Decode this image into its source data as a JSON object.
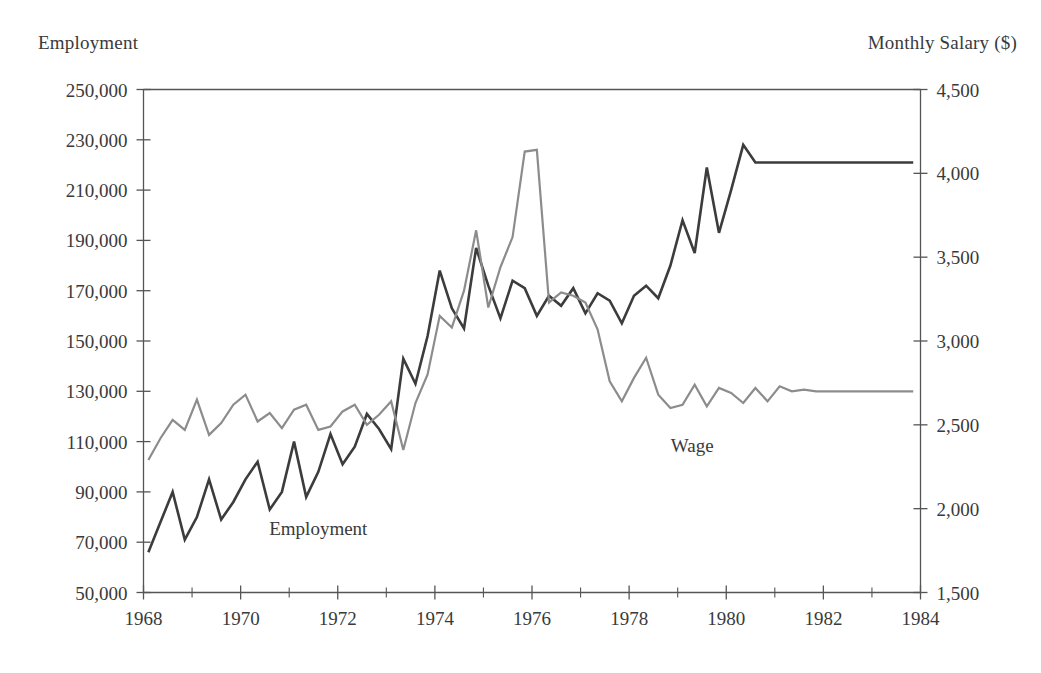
{
  "chart_data": {
    "type": "line",
    "title": "",
    "xlabel": "",
    "ylabel": "Employment",
    "y2label": "Monthly Salary ($)",
    "grid": false,
    "legend_position": "inline-annotation",
    "xlim": [
      1968.0,
      1984.0
    ],
    "ylim": [
      50000,
      250000
    ],
    "y2lim": [
      1500,
      4500
    ],
    "x_ticks": [
      1968,
      1970,
      1972,
      1974,
      1976,
      1978,
      1980,
      1982,
      1984
    ],
    "x_tick_labels": [
      "1968",
      "1970",
      "1972",
      "1974",
      "1976",
      "1978",
      "1980",
      "1982",
      "1984"
    ],
    "x_minor_ticks": [
      1969,
      1971,
      1973,
      1975,
      1977,
      1979,
      1981,
      1983
    ],
    "y_ticks": [
      50000,
      70000,
      90000,
      110000,
      130000,
      150000,
      170000,
      190000,
      210000,
      230000,
      250000
    ],
    "y_tick_labels": [
      "50,000",
      "70,000",
      "90,000",
      "110,000",
      "130,000",
      "150,000",
      "170,000",
      "190,000",
      "210,000",
      "230,000",
      "250,000"
    ],
    "y2_ticks": [
      1500,
      2000,
      2500,
      3000,
      3500,
      4000,
      4500
    ],
    "y2_tick_labels": [
      "1,500",
      "2,000",
      "2,500",
      "3,000",
      "3,500",
      "4,000",
      "4,500"
    ],
    "x": [
      1968.1,
      1968.35,
      1968.6,
      1968.85,
      1969.1,
      1969.35,
      1969.6,
      1969.85,
      1970.1,
      1970.35,
      1970.6,
      1970.85,
      1971.1,
      1971.35,
      1971.6,
      1971.85,
      1972.1,
      1972.35,
      1972.6,
      1972.85,
      1973.1,
      1973.35,
      1973.6,
      1973.85,
      1974.1,
      1974.35,
      1974.6,
      1974.85,
      1975.1,
      1975.35,
      1975.6,
      1975.85,
      1976.1,
      1976.35,
      1976.6,
      1976.85,
      1977.1,
      1977.35,
      1977.6,
      1977.85,
      1978.1,
      1978.35,
      1978.6,
      1978.85,
      1979.1,
      1979.35,
      1979.6,
      1979.85,
      1980.1,
      1980.35,
      1980.6,
      1980.85,
      1981.1,
      1981.35,
      1981.6,
      1981.85,
      1982.1,
      1982.35,
      1982.6,
      1982.85,
      1983.1,
      1983.35,
      1983.6,
      1983.85
    ],
    "series": [
      {
        "name": "Employment",
        "axis": "left",
        "color": "#3c3c3c",
        "units": "persons",
        "values": [
          66000,
          78000,
          90000,
          71000,
          80000,
          95000,
          79000,
          86000,
          95000,
          102000,
          83000,
          90000,
          110000,
          88000,
          98000,
          113000,
          101000,
          108000,
          121000,
          115000,
          107000,
          143000,
          133000,
          152000,
          178000,
          163000,
          155000,
          187000,
          172000,
          159000,
          174000,
          171000,
          160000,
          168000,
          164000,
          171000,
          161000,
          169000,
          166000,
          157000,
          168000,
          172000,
          167000,
          180000,
          198000,
          185000,
          219000,
          193000,
          210000,
          228000,
          221000,
          221000,
          221000,
          221000,
          221000,
          221000,
          221000,
          221000,
          221000,
          221000,
          221000,
          221000,
          221000,
          221000
        ]
      },
      {
        "name": "Wage",
        "axis": "right",
        "color": "#8c8c8c",
        "units": "dollars per month",
        "values": [
          2290,
          2420,
          2530,
          2470,
          2650,
          2440,
          2510,
          2620,
          2680,
          2520,
          2570,
          2480,
          2590,
          2620,
          2470,
          2490,
          2580,
          2620,
          2500,
          2560,
          2640,
          2350,
          2630,
          2800,
          3150,
          3080,
          3300,
          3660,
          3200,
          3440,
          3620,
          4130,
          4140,
          3230,
          3290,
          3270,
          3230,
          3070,
          2760,
          2640,
          2780,
          2900,
          2680,
          2600,
          2620,
          2740,
          2610,
          2720,
          2690,
          2630,
          2720,
          2640,
          2730,
          2700,
          2710,
          2700,
          2700,
          2700,
          2700,
          2700,
          2700,
          2700,
          2700,
          2700
        ]
      }
    ],
    "annotations": [
      {
        "text": "Employment",
        "x": 1971.6,
        "y": 73000,
        "axis": "left"
      },
      {
        "text": "Wage",
        "x": 1979.3,
        "y": 106000,
        "axis": "left"
      }
    ]
  }
}
